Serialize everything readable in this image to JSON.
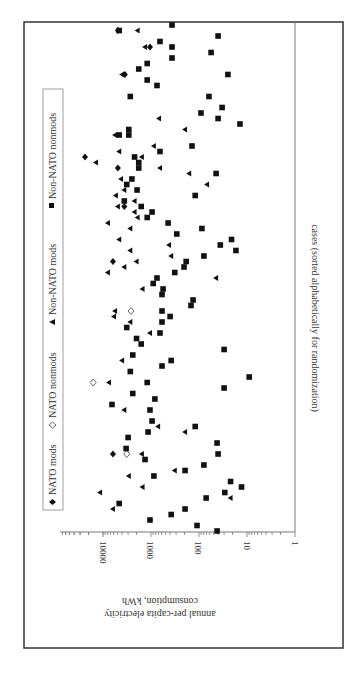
{
  "chart_data": {
    "type": "scatter",
    "orientation_note": "figure rotated 90 degrees; value axis horizontal (log), cases vertical",
    "title": "",
    "xlabel": "cases (sorted alphabetically for randomization)",
    "ylabel": "annual per-capita electricity consumption, kWh",
    "yscale": "log",
    "ylim": [
      1,
      60000
    ],
    "y_ticks": [
      "10000",
      "1000",
      "100",
      "10",
      "1"
    ],
    "grid": false,
    "legend_position": "left (top of rotated figure)",
    "legend": [
      {
        "name": "NATO mods",
        "marker": "filled-diamond",
        "symbol": "♦"
      },
      {
        "name": "NATO nonmods",
        "marker": "open-diamond",
        "symbol": "◇"
      },
      {
        "name": "Non-NATO mods",
        "marker": "filled-triangle",
        "symbol": "▲"
      },
      {
        "name": "Non-NATO nonmods",
        "marker": "filled-square",
        "symbol": "■"
      }
    ],
    "series": [
      {
        "name": "NATO mods",
        "points": [
          [
            1,
            4900
          ],
          [
            4,
            1050
          ],
          [
            9,
            3500
          ],
          [
            24,
            23700
          ],
          [
            26,
            4900
          ],
          [
            33,
            3600
          ],
          [
            43,
            6200
          ],
          [
            78,
            6200
          ]
        ]
      },
      {
        "name": "NATO nonmods",
        "points": [
          [
            52,
            2600
          ],
          [
            65,
            16000
          ],
          [
            78,
            3200
          ]
        ]
      },
      {
        "name": "Non-NATO mods",
        "points": [
          [
            1,
            1900
          ],
          [
            4,
            1330
          ],
          [
            9,
            4000
          ],
          [
            17,
            680
          ],
          [
            19,
            195
          ],
          [
            20,
            5600
          ],
          [
            22,
            870
          ],
          [
            23,
            4600
          ],
          [
            25,
            14000
          ],
          [
            24,
            1550
          ],
          [
            26,
            650
          ],
          [
            27,
            160
          ],
          [
            28,
            4200
          ],
          [
            29,
            68
          ],
          [
            30,
            3600
          ],
          [
            31,
            5400
          ],
          [
            32,
            2200
          ],
          [
            33,
            4900
          ],
          [
            34,
            2200
          ],
          [
            35,
            1900
          ],
          [
            36,
            7900
          ],
          [
            37,
            2700
          ],
          [
            39,
            4600
          ],
          [
            41,
            2700
          ],
          [
            40,
            420
          ],
          [
            42,
            380
          ],
          [
            43,
            2000
          ],
          [
            45,
            7900
          ],
          [
            44,
            3600
          ],
          [
            46,
            44
          ],
          [
            48,
            1500
          ],
          [
            52,
            5600
          ],
          [
            53,
            5900
          ],
          [
            54,
            2700
          ],
          [
            56,
            1050
          ],
          [
            61,
            4000
          ],
          [
            65,
            7500
          ],
          [
            70,
            3600
          ],
          [
            73,
            710
          ],
          [
            74,
            195
          ],
          [
            78,
            1550
          ],
          [
            81,
            320
          ],
          [
            82,
            2900
          ],
          [
            84,
            1500
          ],
          [
            85,
            11500
          ],
          [
            86,
            22
          ],
          [
            88,
            6200
          ]
        ]
      },
      {
        "name": "Non-NATO nonmods",
        "points": [
          [
            0,
            365
          ],
          [
            1,
            4600
          ],
          [
            2,
            40
          ],
          [
            3,
            650
          ],
          [
            4,
            365
          ],
          [
            5,
            56
          ],
          [
            6,
            365
          ],
          [
            7,
            1200
          ],
          [
            8,
            1800
          ],
          [
            9,
            25
          ],
          [
            10,
            1200
          ],
          [
            11,
            750
          ],
          [
            13,
            2700
          ],
          [
            13,
            62
          ],
          [
            15,
            33
          ],
          [
            16,
            91
          ],
          [
            17,
            40
          ],
          [
            18,
            14
          ],
          [
            19,
            2900
          ],
          [
            20,
            4600
          ],
          [
            20,
            2900
          ],
          [
            22,
            140
          ],
          [
            23,
            650
          ],
          [
            24,
            2200
          ],
          [
            25,
            1800
          ],
          [
            26,
            1800
          ],
          [
            27,
            44
          ],
          [
            28,
            2500
          ],
          [
            29,
            3200
          ],
          [
            30,
            1950
          ],
          [
            31,
            120
          ],
          [
            32,
            3600
          ],
          [
            33,
            1600
          ],
          [
            34,
            950
          ],
          [
            35,
            1200
          ],
          [
            36,
            440
          ],
          [
            37,
            87
          ],
          [
            38,
            290
          ],
          [
            39,
            21
          ],
          [
            40,
            36
          ],
          [
            41,
            17
          ],
          [
            42,
            79
          ],
          [
            43,
            185
          ],
          [
            44,
            205
          ],
          [
            45,
            320
          ],
          [
            46,
            750
          ],
          [
            47,
            900
          ],
          [
            48,
            560
          ],
          [
            49,
            590
          ],
          [
            50,
            133
          ],
          [
            51,
            147
          ],
          [
            52,
            590
          ],
          [
            53,
            400
          ],
          [
            54,
            590
          ],
          [
            55,
            3200
          ],
          [
            56,
            650
          ],
          [
            57,
            2000
          ],
          [
            58,
            1600
          ],
          [
            59,
            30
          ],
          [
            60,
            2400
          ],
          [
            61,
            380
          ],
          [
            62,
            590
          ],
          [
            63,
            2700
          ],
          [
            64,
            9
          ],
          [
            65,
            1200
          ],
          [
            66,
            30
          ],
          [
            67,
            2400
          ],
          [
            68,
            830
          ],
          [
            69,
            6500
          ],
          [
            70,
            1050
          ],
          [
            72,
            950
          ],
          [
            73,
            120
          ],
          [
            74,
            1150
          ],
          [
            75,
            3000
          ],
          [
            76,
            42
          ],
          [
            77,
            3300
          ],
          [
            79,
            1330
          ],
          [
            78,
            40
          ],
          [
            80,
            79
          ],
          [
            81,
            195
          ],
          [
            82,
            870
          ],
          [
            83,
            22
          ],
          [
            84,
            13
          ],
          [
            85,
            29
          ],
          [
            86,
            71
          ],
          [
            87,
            4600
          ],
          [
            88,
            195
          ],
          [
            89,
            380
          ],
          [
            90,
            1050
          ],
          [
            91,
            110
          ],
          [
            92,
            42
          ]
        ]
      }
    ]
  },
  "labels": {
    "xlabel": "cases (sorted alphabetically for randomization)",
    "ylabel_line1": "annual per-capita electricity",
    "ylabel_line2": "consumption, kWh",
    "tick_10000": "10000",
    "tick_1000": "1000",
    "tick_100": "100",
    "tick_10": "10",
    "tick_1": "1",
    "legend_nato_mods": "NATO mods",
    "legend_nato_nonmods": "NATO nonmods",
    "legend_nonnato_mods": "Non-NATO mods",
    "legend_nonnato_nonmods": "Non-NATO nonmods"
  }
}
